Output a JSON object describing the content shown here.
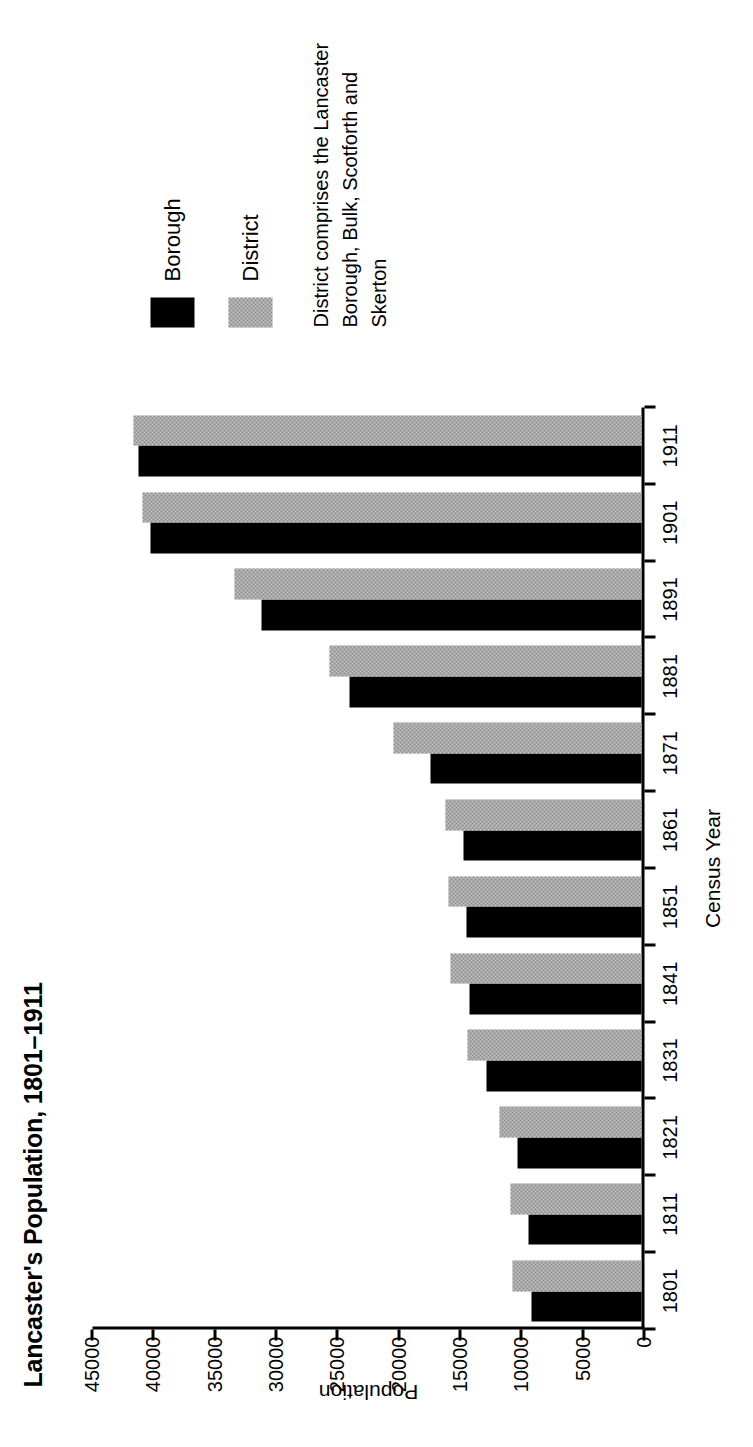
{
  "chart_data": {
    "type": "bar",
    "orientation": "vertical",
    "title": "Lancaster's Population, 1801–1911",
    "xlabel": "Census Year",
    "ylabel": "Population",
    "ylim": [
      0,
      45000
    ],
    "ytick_step": 5000,
    "yticks": [
      0,
      5000,
      10000,
      15000,
      20000,
      25000,
      30000,
      35000,
      40000,
      45000
    ],
    "ytick_labels": [
      "0",
      "5000",
      "10000",
      "15000",
      "20000",
      "25000",
      "30000",
      "35000",
      "40000",
      "45000"
    ],
    "grid": false,
    "legend_position": "right",
    "categories": [
      "1801",
      "1811",
      "1821",
      "1831",
      "1841",
      "1851",
      "1861",
      "1871",
      "1881",
      "1891",
      "1901",
      "1911"
    ],
    "series": [
      {
        "name": "Borough",
        "color": "#000000",
        "values": [
          9000,
          9200,
          10100,
          12600,
          14000,
          14300,
          14500,
          17200,
          23800,
          31000,
          40000,
          41000
        ]
      },
      {
        "name": "District",
        "color": "#8a8a8a",
        "values": [
          10500,
          10700,
          11600,
          14200,
          15600,
          15700,
          16000,
          20200,
          25400,
          33200,
          40700,
          41400
        ]
      }
    ],
    "annotations": [
      "District comprises the Lancaster Borough, Bulk, Scotforth and Skerton"
    ]
  },
  "legend": {
    "items": [
      {
        "label": "Borough",
        "color": "#000000",
        "swatch": "solid-black"
      },
      {
        "label": "District",
        "color": "#8a8a8a",
        "swatch": "halftone-grey"
      }
    ],
    "note_line_1": "District comprises the Lancaster",
    "note_line_2": "Borough, Bulk, Scotforth and Skerton"
  }
}
